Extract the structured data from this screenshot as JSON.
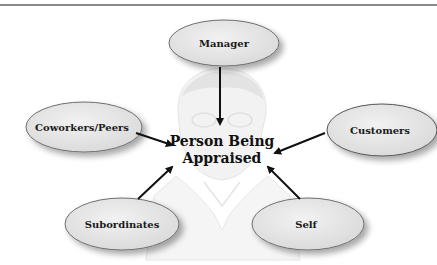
{
  "diagram": {
    "title": "",
    "center": {
      "line1": "Person Being",
      "line2": "Appraised"
    },
    "nodes": [
      {
        "id": "manager",
        "label": "Manager"
      },
      {
        "id": "coworkers",
        "label": "Coworkers/Peers"
      },
      {
        "id": "customers",
        "label": "Customers"
      },
      {
        "id": "subordinates",
        "label": "Subordinates"
      },
      {
        "id": "self",
        "label": "Self"
      }
    ],
    "edges": [
      {
        "from": "manager",
        "to": "center"
      },
      {
        "from": "coworkers",
        "to": "center"
      },
      {
        "from": "customers",
        "to": "center"
      },
      {
        "from": "subordinates",
        "to": "center"
      },
      {
        "from": "self",
        "to": "center"
      }
    ],
    "colors": {
      "ellipse_fill": "#e6e6e6",
      "ellipse_stroke": "#6e6e6e",
      "arrow": "#111111",
      "figure": "#d8d8d8"
    }
  }
}
